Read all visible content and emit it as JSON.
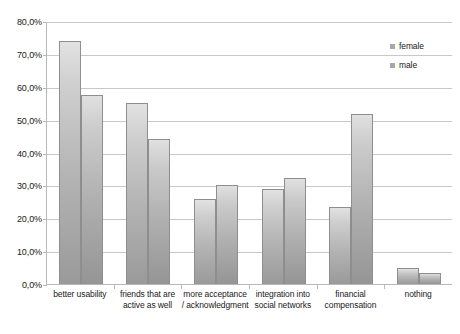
{
  "chart_data": {
    "type": "bar",
    "title": "",
    "subtitle": "",
    "xlabel": "",
    "ylabel": "",
    "ylim": [
      0,
      80
    ],
    "ytick_labels": [
      "0,0%",
      "10,0%",
      "20,0%",
      "30,0%",
      "40,0%",
      "50,0%",
      "60,0%",
      "70,0%",
      "80,0%"
    ],
    "ytick_values": [
      0,
      10,
      20,
      30,
      40,
      50,
      60,
      70,
      80
    ],
    "grid": true,
    "legend_position": "top-right",
    "categories": [
      "better usability",
      "friends that are active as well",
      "more acceptance / acknowledgment",
      "integration into social networks",
      "financial compensation",
      "nothing"
    ],
    "series": [
      {
        "name": "female",
        "color": "#b4b4b4",
        "values": [
          74.0,
          55.2,
          26.0,
          28.8,
          23.4,
          5.0
        ]
      },
      {
        "name": "male",
        "color": "#b0b0b0",
        "values": [
          57.6,
          44.2,
          30.0,
          32.4,
          51.8,
          3.2
        ]
      }
    ]
  },
  "legend": {
    "items": [
      {
        "label": "female"
      },
      {
        "label": "male"
      }
    ]
  }
}
